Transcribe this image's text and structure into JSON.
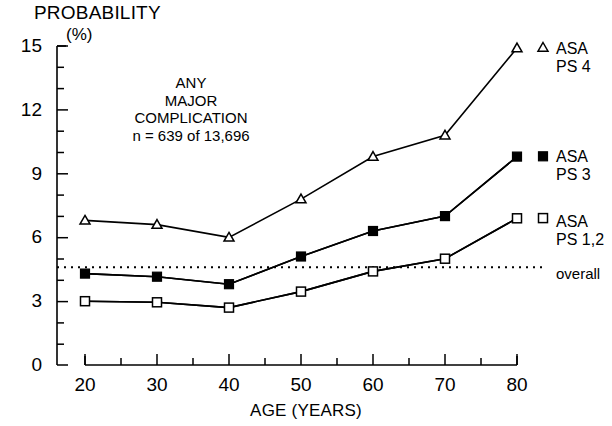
{
  "axes": {
    "y_title": "PROBABILITY",
    "y_units": "(%)",
    "y_ticks": [
      "0",
      "3",
      "6",
      "9",
      "12",
      "15"
    ],
    "x_title": "AGE (YEARS)",
    "x_ticks": [
      "20",
      "30",
      "40",
      "50",
      "60",
      "70",
      "80"
    ]
  },
  "annotation": {
    "line1": "ANY",
    "line2": "MAJOR",
    "line3": "COMPLICATION",
    "line4": "n = 639 of 13,696"
  },
  "legend": {
    "asa_ps_4": "ASA PS 4",
    "asa_ps_3": "ASA PS 3",
    "asa_ps_12": "ASA PS 1,2",
    "overall": "overall"
  },
  "colors": {
    "line": "#000000",
    "background": "#ffffff"
  },
  "chart_data": {
    "type": "line",
    "title": "ANY MAJOR COMPLICATION",
    "subtitle": "n = 639 of 13,696",
    "xlabel": "AGE (YEARS)",
    "ylabel": "PROBABILITY (%)",
    "xlim": [
      20,
      80
    ],
    "ylim": [
      0,
      15
    ],
    "xticks": [
      20,
      30,
      40,
      50,
      60,
      70,
      80
    ],
    "yticks": [
      0,
      3,
      6,
      9,
      12,
      15
    ],
    "x_minor_tick_interval": 5,
    "y_minor_tick_interval": 1,
    "grid": false,
    "legend_position": "right-inline",
    "x": [
      20,
      30,
      40,
      50,
      60,
      70,
      80
    ],
    "series": [
      {
        "name": "ASA PS 4",
        "marker": "open-triangle",
        "values": [
          6.8,
          6.6,
          6.0,
          7.8,
          9.8,
          10.8,
          14.9
        ]
      },
      {
        "name": "ASA PS 3",
        "marker": "filled-square",
        "values": [
          4.3,
          4.15,
          3.8,
          5.1,
          6.3,
          7.0,
          9.8
        ]
      },
      {
        "name": "ASA PS 1,2",
        "marker": "open-square",
        "values": [
          3.0,
          2.95,
          2.7,
          3.45,
          4.4,
          5.0,
          6.9
        ]
      }
    ],
    "reference_line": {
      "name": "overall",
      "style": "dotted",
      "value": 4.6
    }
  }
}
